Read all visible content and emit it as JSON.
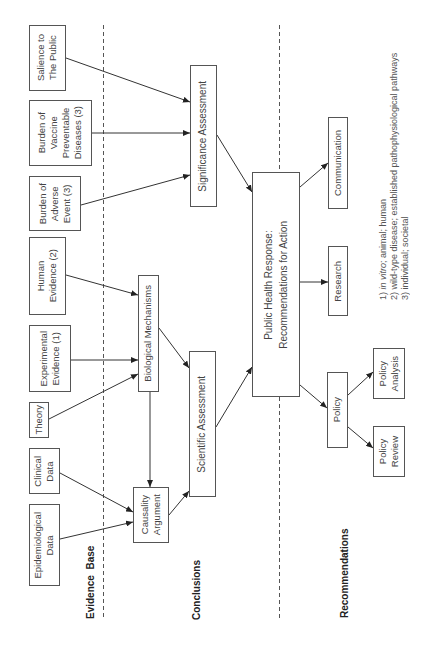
{
  "sections": {
    "evidence_base": "Evidence  Base",
    "conclusions": "Conclusions",
    "recommendations": "Recommendations"
  },
  "nodes": {
    "salience": "Salience to\nThe Public",
    "vaccine_burden": "Burden of\nVaccine\nPreventable\nDiseases (3)",
    "adverse_burden": "Burden of\nAdverse\nEvent (3)",
    "human_evidence": "Human\nEvidence (2)",
    "experimental_evidence": "Experimental\nEvidence (1)",
    "theory": "Theory",
    "clinical_data": "Clinical\nData",
    "epidemiological_data": "Epidemiological\nData",
    "significance_assessment": "Significance Assessment",
    "biological_mechanisms": "Biological Mechanisms",
    "causality_argument": "Causality\nArgument",
    "scientific_assessment": "Scientific Assessment",
    "public_health_response": "Public Health Response:\nRecommendations for Action",
    "communication": "Communication",
    "research": "Research",
    "policy": "Policy",
    "policy_analysis": "Policy\nAnalysis",
    "policy_review": "Policy\nReview"
  },
  "footnotes": [
    {
      "prefix": "1) ",
      "italic": "in vitro",
      "suffix": "; animal; human"
    },
    {
      "text": "2) wild-type disease; established pathophysiological pathways"
    },
    {
      "text": "3) individual; societal"
    }
  ],
  "edges": [
    {
      "from": "salience",
      "to": "significance_assessment"
    },
    {
      "from": "vaccine_burden",
      "to": "significance_assessment"
    },
    {
      "from": "adverse_burden",
      "to": "significance_assessment"
    },
    {
      "from": "human_evidence",
      "to": "biological_mechanisms"
    },
    {
      "from": "experimental_evidence",
      "to": "biological_mechanisms"
    },
    {
      "from": "theory",
      "to": "biological_mechanisms"
    },
    {
      "from": "clinical_data",
      "to": "causality_argument"
    },
    {
      "from": "epidemiological_data",
      "to": "causality_argument"
    },
    {
      "from": "biological_mechanisms",
      "to": "causality_argument"
    },
    {
      "from": "biological_mechanisms",
      "to": "scientific_assessment"
    },
    {
      "from": "causality_argument",
      "to": "scientific_assessment"
    },
    {
      "from": "significance_assessment",
      "to": "public_health_response"
    },
    {
      "from": "scientific_assessment",
      "to": "public_health_response"
    },
    {
      "from": "public_health_response",
      "to": "communication"
    },
    {
      "from": "public_health_response",
      "to": "research"
    },
    {
      "from": "public_health_response",
      "to": "policy"
    },
    {
      "from": "policy",
      "to": "policy_analysis"
    },
    {
      "from": "policy",
      "to": "policy_review"
    }
  ]
}
